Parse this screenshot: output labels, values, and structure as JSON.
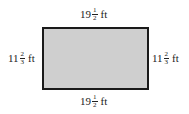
{
  "diagram": {
    "shape": "rectangle",
    "fill_color": "#cfcfcf",
    "border_color": "#1a1a1a",
    "labels": {
      "top": {
        "whole": "19",
        "numerator": "1",
        "denominator": "2",
        "unit": "ft"
      },
      "bottom": {
        "whole": "19",
        "numerator": "1",
        "denominator": "2",
        "unit": "ft"
      },
      "left": {
        "whole": "11",
        "numerator": "2",
        "denominator": "3",
        "unit": "ft"
      },
      "right": {
        "whole": "11",
        "numerator": "2",
        "denominator": "3",
        "unit": "ft"
      }
    }
  }
}
